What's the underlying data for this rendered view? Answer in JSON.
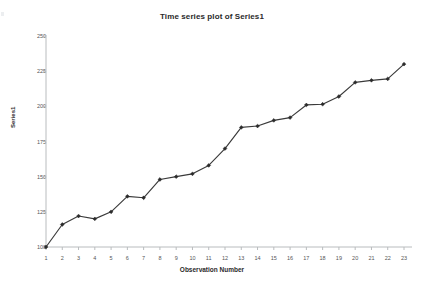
{
  "chart": {
    "title": "Time series plot of Series1",
    "xlabel": "Observation Number",
    "ylabel": "Series1"
  },
  "chart_data": {
    "type": "line",
    "title": "Time series plot of Series1",
    "xlabel": "Observation Number",
    "ylabel": "Series1",
    "x": [
      1,
      2,
      3,
      4,
      5,
      6,
      7,
      8,
      9,
      10,
      11,
      12,
      13,
      14,
      15,
      16,
      17,
      18,
      19,
      20,
      21,
      22,
      23
    ],
    "values": [
      100,
      116,
      122,
      120,
      125,
      136,
      135,
      148,
      150,
      152,
      158,
      170,
      185,
      186,
      190,
      192,
      201,
      201.5,
      207,
      217,
      218.5,
      219.5,
      230
    ],
    "series": [
      {
        "name": "Series1",
        "values": [
          100,
          116,
          122,
          120,
          125,
          136,
          135,
          148,
          150,
          152,
          158,
          170,
          185,
          186,
          190,
          192,
          201,
          201.5,
          207,
          217,
          218.5,
          219.5,
          230
        ]
      }
    ],
    "xlim": [
      1,
      23
    ],
    "ylim": [
      100,
      250
    ],
    "yticks": [
      100,
      125,
      150,
      175,
      200,
      225,
      250
    ],
    "xticks": [
      1,
      2,
      3,
      4,
      5,
      6,
      7,
      8,
      9,
      10,
      11,
      12,
      13,
      14,
      15,
      16,
      17,
      18,
      19,
      20,
      21,
      22,
      23
    ],
    "grid": false,
    "legend": "none",
    "line_color": "#3a3a3a",
    "marker": "diamond",
    "marker_color": "#2b2b2b"
  },
  "axis": {
    "ytick_labels": [
      "250",
      "225",
      "200",
      "175",
      "150",
      "125",
      "100"
    ],
    "xtick_labels": [
      "1",
      "2",
      "3",
      "4",
      "5",
      "6",
      "7",
      "8",
      "9",
      "10",
      "11",
      "12",
      "13",
      "14",
      "15",
      "16",
      "17",
      "18",
      "19",
      "20",
      "21",
      "22",
      "23"
    ]
  }
}
